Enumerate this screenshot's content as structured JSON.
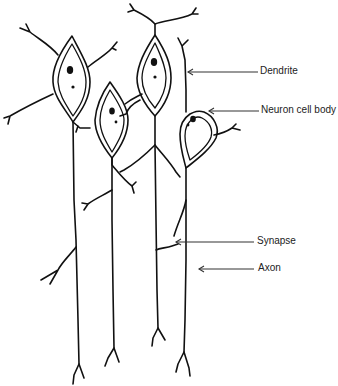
{
  "diagram": {
    "labels": {
      "dendrite": "Dendrite",
      "cell_body": "Neuron cell body",
      "synapse": "Synapse",
      "axon": "Axon"
    },
    "neuron_count": 4,
    "colors": {
      "ink": "#111111",
      "background": "#ffffff"
    }
  }
}
